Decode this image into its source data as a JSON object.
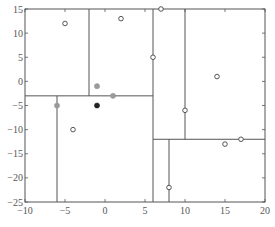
{
  "chart_data": {
    "type": "scatter",
    "title": "",
    "xlabel": "",
    "ylabel": "",
    "xlim": [
      -10,
      20
    ],
    "ylim": [
      -25,
      15
    ],
    "grid": false,
    "x_ticks": [
      -10,
      -5,
      0,
      5,
      10,
      15,
      20
    ],
    "y_ticks": [
      15,
      10,
      5,
      0,
      -5,
      -10,
      -15,
      -20,
      -25
    ],
    "x_tick_labels": [
      "−10",
      "−5",
      "0",
      "5",
      "10",
      "15",
      "20"
    ],
    "y_tick_labels": [
      "15",
      "10",
      "5",
      "0",
      "−5",
      "−10",
      "−15",
      "−20",
      "−25"
    ],
    "points": [
      {
        "x": -5,
        "y": 12,
        "style": "open"
      },
      {
        "x": 2,
        "y": 13,
        "style": "open"
      },
      {
        "x": 7,
        "y": 15,
        "style": "open"
      },
      {
        "x": 6,
        "y": 5,
        "style": "open"
      },
      {
        "x": 14,
        "y": 1,
        "style": "open"
      },
      {
        "x": 10,
        "y": -6,
        "style": "open"
      },
      {
        "x": -4,
        "y": -10,
        "style": "open"
      },
      {
        "x": 17,
        "y": -12,
        "style": "open"
      },
      {
        "x": 15,
        "y": -13,
        "style": "open"
      },
      {
        "x": 8,
        "y": -22,
        "style": "open"
      },
      {
        "x": -1,
        "y": -1,
        "style": "gray"
      },
      {
        "x": 1,
        "y": -3,
        "style": "gray"
      },
      {
        "x": -6,
        "y": -5,
        "style": "gray"
      },
      {
        "x": -1,
        "y": -5,
        "style": "black"
      }
    ],
    "partition_lines": [
      {
        "orientation": "vertical",
        "x": 6,
        "y_from": -25,
        "y_to": 15
      },
      {
        "orientation": "horizontal",
        "y": -3,
        "x_from": -10,
        "x_to": 6
      },
      {
        "orientation": "vertical",
        "x": -2,
        "y_from": -3,
        "y_to": 15
      },
      {
        "orientation": "vertical",
        "x": -6,
        "y_from": -25,
        "y_to": -3
      },
      {
        "orientation": "horizontal",
        "y": -12,
        "x_from": 6,
        "x_to": 20
      },
      {
        "orientation": "vertical",
        "x": 10,
        "y_from": -12,
        "y_to": 15
      },
      {
        "orientation": "vertical",
        "x": 8,
        "y_from": -25,
        "y_to": -12
      }
    ],
    "colors": {
      "axis": "#555555",
      "line": "#555555",
      "gray_point": "#999999",
      "black_point": "#222222"
    }
  }
}
